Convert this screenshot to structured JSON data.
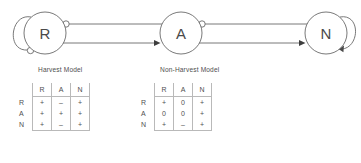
{
  "figure": {
    "diagram": {
      "nodes": [
        {
          "id": "R",
          "label": "R",
          "cx": 45,
          "cy": 33,
          "r": 21
        },
        {
          "id": "A",
          "label": "A",
          "cx": 181,
          "cy": 33,
          "r": 21
        },
        {
          "id": "N",
          "label": "N",
          "cx": 326,
          "cy": 33,
          "r": 21
        }
      ],
      "self_loops": [
        {
          "node": "R",
          "side": "left",
          "terminator": "circle",
          "sign": "negative"
        },
        {
          "node": "N",
          "side": "right",
          "terminator": "arrow",
          "sign": "positive"
        }
      ],
      "links": [
        {
          "from": "R",
          "to": "A",
          "terminator": "circle",
          "sign": "negative",
          "position": "upper"
        },
        {
          "from": "A",
          "to": "R",
          "terminator": "arrow",
          "sign": "positive",
          "position": "lower"
        },
        {
          "from": "A",
          "to": "N",
          "terminator": "circle",
          "sign": "negative",
          "position": "upper"
        },
        {
          "from": "N",
          "to": "A",
          "terminator": "arrow",
          "sign": "positive",
          "position": "lower"
        }
      ]
    },
    "models": [
      {
        "id": "harvest",
        "caption": "Harvest Model",
        "columns": [
          "R",
          "A",
          "N"
        ],
        "rows": [
          {
            "label": "R",
            "values": [
              "+",
              "–",
              "+"
            ]
          },
          {
            "label": "A",
            "values": [
              "+",
              "+",
              "+"
            ]
          },
          {
            "label": "N",
            "values": [
              "+",
              "–",
              "+"
            ]
          }
        ]
      },
      {
        "id": "nonharvest",
        "caption": "Non-Harvest Model",
        "columns": [
          "R",
          "A",
          "N"
        ],
        "rows": [
          {
            "label": "R",
            "values": [
              "+",
              "0",
              "+"
            ]
          },
          {
            "label": "A",
            "values": [
              "0",
              "0",
              "+"
            ]
          },
          {
            "label": "N",
            "values": [
              "+",
              "–",
              "+"
            ]
          }
        ]
      }
    ]
  },
  "colors": {
    "stroke": "#555555",
    "text": "#4f4f4f",
    "rule": "#b9b9b9",
    "background": "#ffffff"
  }
}
